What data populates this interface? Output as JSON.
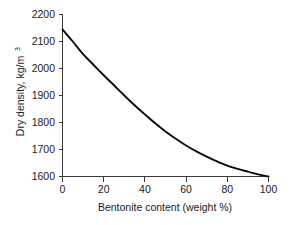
{
  "chart_data": {
    "type": "line",
    "title": "",
    "subtitle": "",
    "xlabel": "Bentonite content (weight %)",
    "ylabel": "Dry density, kg/m",
    "ylabel_superscript": "3",
    "ylabel_full": "Dry density, kg/m3",
    "xlim": [
      0,
      100
    ],
    "ylim": [
      1600,
      2200
    ],
    "xticks": [
      0,
      20,
      40,
      60,
      80,
      100
    ],
    "yticks": [
      1600,
      1700,
      1800,
      1900,
      2000,
      2100,
      2200
    ],
    "xtick_labels": [
      "0",
      "20",
      "40",
      "60",
      "80",
      "100"
    ],
    "ytick_labels": [
      "1600",
      "1700",
      "1800",
      "1900",
      "2000",
      "2100",
      "2200"
    ],
    "grid": false,
    "legend": null,
    "series": [
      {
        "name": "Dry density vs bentonite content",
        "color": "#0a0a0a",
        "x": [
          0,
          5,
          10,
          15,
          20,
          25,
          30,
          35,
          40,
          45,
          50,
          55,
          60,
          65,
          70,
          75,
          80,
          85,
          90,
          95,
          100
        ],
        "y": [
          2145,
          2100,
          2053,
          2014,
          1975,
          1938,
          1900,
          1864,
          1830,
          1797,
          1767,
          1740,
          1715,
          1693,
          1674,
          1656,
          1640,
          1628,
          1618,
          1608,
          1600
        ]
      }
    ],
    "annotations": []
  },
  "axis": {
    "x_tick_labels": [
      "0",
      "20",
      "40",
      "60",
      "80",
      "100"
    ],
    "y_tick_labels": [
      "1600",
      "1700",
      "1800",
      "1900",
      "2000",
      "2100",
      "2200"
    ],
    "x_title": "Bentonite content (weight %)",
    "y_title": "Dry density, kg/m",
    "y_title_sup": "3"
  },
  "colors": {
    "curve": "#0a0a0a",
    "axis": "#3a3a3a",
    "text": "#1a1a1a",
    "background": "#ffffff"
  }
}
